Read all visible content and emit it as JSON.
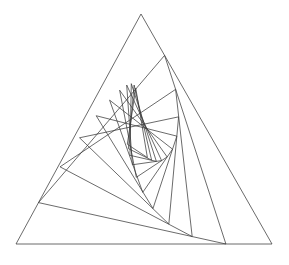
{
  "figure": {
    "background_color": "#ffffff",
    "stroke_color": "#3a3a3a",
    "stroke_width": 0.75,
    "canvas": {
      "width": 289,
      "height": 265
    }
  },
  "chart_data": {
    "type": "line",
    "xlabel": "",
    "ylabel": "",
    "grid": false,
    "legend": "none",
    "xlim": [
      0,
      289
    ],
    "ylim": [
      0,
      265
    ],
    "outer_triangle": {
      "apex": [
        141,
        14
      ],
      "bottom_left": [
        16,
        244
      ],
      "bottom_right": [
        272,
        244
      ]
    },
    "iterations": 11,
    "inset_ratio": 0.18,
    "winding": "clockwise",
    "series": [
      {
        "name": "triangle-0",
        "points": [
          [
            141,
            14
          ],
          [
            272,
            244
          ],
          [
            16,
            244
          ]
        ]
      },
      {
        "name": "triangle-1",
        "points": [
          [
            164.58,
            55.4
          ],
          [
            225.92,
            244
          ],
          [
            38.5,
            202.6
          ]
        ]
      },
      {
        "name": "triangle-2",
        "points": [
          [
            175.62,
            89.35
          ],
          [
            192.18,
            236.55
          ],
          [
            60.04,
            166.83
          ]
        ]
      },
      {
        "name": "triangle-3",
        "points": [
          [
            178.6,
            116.85
          ],
          [
            168.84,
            224.02
          ],
          [
            79.52,
            137.79
          ]
        ]
      },
      {
        "name": "triangle-4",
        "points": [
          [
            176.84,
            136.14
          ],
          [
            152.98,
            208.52
          ],
          [
            96.2,
            115.74
          ]
        ]
      },
      {
        "name": "triangle-5",
        "points": [
          [
            172.54,
            149.17
          ],
          [
            142.74,
            192.37
          ],
          [
            109.57,
            100.11
          ]
        ]
      },
      {
        "name": "triangle-6",
        "points": [
          [
            167.17,
            156.95
          ],
          [
            136.32,
            177.31
          ],
          [
            119.63,
            90.2
          ]
        ]
      },
      {
        "name": "triangle-7",
        "points": [
          [
            161.62,
            160.62
          ],
          [
            132.39,
            164.78
          ],
          [
            126.69,
            85.03
          ]
        ]
      },
      {
        "name": "triangle-8",
        "points": [
          [
            156.36,
            161.37
          ],
          [
            129.95,
            155.3
          ],
          [
            131.31,
            83.68
          ]
        ]
      },
      {
        "name": "triangle-9",
        "points": [
          [
            151.61,
            160.13
          ],
          [
            128.38,
            148.64
          ],
          [
            134.14,
            85.05
          ]
        ]
      },
      {
        "name": "triangle-10",
        "points": [
          [
            147.4,
            157.55
          ],
          [
            127.31,
            144.26
          ],
          [
            135.74,
            88.15
          ]
        ]
      }
    ]
  }
}
